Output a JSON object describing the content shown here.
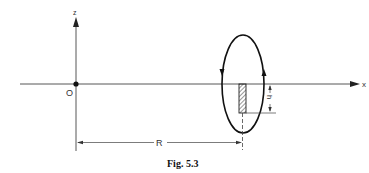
{
  "figure": {
    "caption": "Fig. 5.3",
    "axes": {
      "x_label": "x",
      "z_label": "z",
      "origin_label": "O"
    },
    "loop": {
      "description": "elliptical current loop in a plane perpendicular to x-axis, circulating down on left and up on right"
    },
    "dimensions": {
      "R_label": "R",
      "h_label": "h"
    },
    "element": {
      "description": "hatched rectangular element hanging below x-axis at distance R"
    },
    "colors": {
      "line": "#222222",
      "thin_line": "#555555",
      "background": "#ffffff"
    }
  }
}
